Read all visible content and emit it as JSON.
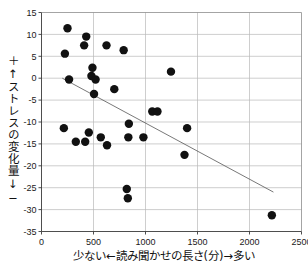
{
  "chart_data": {
    "type": "scatter",
    "title": "",
    "xlabel": "少ない←読み聞かせの長さ(分)→多い",
    "ylabel": "＋↑ストレスの変化量↓−",
    "xlim": [
      0,
      2500
    ],
    "ylim": [
      -35,
      15
    ],
    "xticks": [
      0,
      500,
      1000,
      1500,
      2000,
      2500
    ],
    "yticks": [
      15,
      10,
      5,
      0,
      -5,
      -10,
      -15,
      -20,
      -25,
      -30,
      -35
    ],
    "xtick_labels": [
      "0",
      "500",
      "1000",
      "1500",
      "2000",
      "2500"
    ],
    "ytick_labels": [
      "15",
      "10",
      "5",
      "0",
      "-5",
      "-10",
      "-15",
      "-20",
      "-25",
      "-30",
      "-35"
    ],
    "grid": true,
    "legend": false,
    "marker_color": "#111111",
    "marker_size": 4.2,
    "points": [
      [
        250,
        11.4
      ],
      [
        225,
        5.6
      ],
      [
        430,
        9.5
      ],
      [
        410,
        7.5
      ],
      [
        625,
        7.5
      ],
      [
        790,
        6.4
      ],
      [
        490,
        2.4
      ],
      [
        480,
        0.5
      ],
      [
        265,
        -0.3
      ],
      [
        520,
        -0.3
      ],
      [
        505,
        -3.6
      ],
      [
        700,
        -2.5
      ],
      [
        1245,
        1.5
      ],
      [
        215,
        -11.4
      ],
      [
        840,
        -10.4
      ],
      [
        330,
        -14.5
      ],
      [
        420,
        -14.5
      ],
      [
        455,
        -12.4
      ],
      [
        570,
        -13.5
      ],
      [
        630,
        -15.3
      ],
      [
        835,
        -13.5
      ],
      [
        980,
        -13.5
      ],
      [
        1065,
        -7.6
      ],
      [
        1115,
        -7.6
      ],
      [
        1400,
        -11.4
      ],
      [
        1375,
        -17.5
      ],
      [
        820,
        -25.3
      ],
      [
        830,
        -27.4
      ],
      [
        2215,
        -31.3
      ]
    ],
    "trendline": {
      "x0": 200,
      "y0": 0.0,
      "x1": 2230,
      "y1": -26.0,
      "style": "solid",
      "color": "#555555"
    }
  }
}
